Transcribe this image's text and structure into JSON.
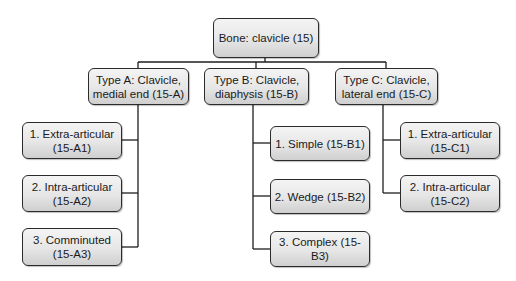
{
  "root": {
    "label": "Bone: clavicle (15)"
  },
  "types": [
    {
      "label": "Type A:   Clavicle,\nmedial end (15-A)",
      "children": [
        {
          "label": "1. Extra-articular\n(15-A1)"
        },
        {
          "label": "2. Intra-articular\n(15-A2)"
        },
        {
          "label": "3. Comminuted\n(15-A3)"
        }
      ]
    },
    {
      "label": "Type B: Clavicle,\ndiaphysis (15-B)",
      "children": [
        {
          "label": "1. Simple (15-B1)"
        },
        {
          "label": "2. Wedge (15-B2)"
        },
        {
          "label": "3. Complex (15-B3)"
        }
      ]
    },
    {
      "label": "Type C:   Clavicle,\nlateral end (15-C)",
      "children": [
        {
          "label": "1. Extra-articular\n(15-C1)"
        },
        {
          "label": "2. Intra-articular\n(15-C2)"
        }
      ]
    }
  ],
  "colors": {
    "line": "#1e1e1e",
    "box_border": "#2b2b2b",
    "box_fill_top": "#f4f4f4",
    "box_fill_bottom": "#cfcfcf"
  }
}
